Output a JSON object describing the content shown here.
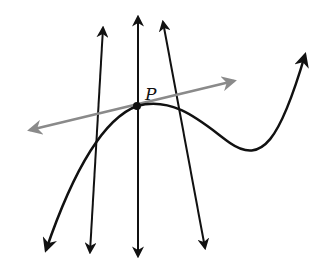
{
  "diagram": {
    "point": {
      "label": "P",
      "x": 137,
      "y": 106
    },
    "colors": {
      "curve": "#111111",
      "lines": "#111111",
      "tangent": "#8a8a8a",
      "point": "#111111"
    },
    "tangent_line": {
      "from": [
        28,
        131
      ],
      "to": [
        236,
        80
      ]
    },
    "lines_through_P": [
      {
        "name": "line-1",
        "from": [
          103,
          26
        ],
        "to": [
          90,
          254
        ]
      },
      {
        "name": "line-2",
        "from": [
          138,
          15
        ],
        "to": [
          138,
          258
        ]
      },
      {
        "name": "line-3",
        "from": [
          163,
          20
        ],
        "to": [
          205,
          250
        ]
      }
    ],
    "curve": {
      "start_arrow": [
        45,
        252
      ],
      "end_arrow": [
        306,
        52
      ],
      "local_min": [
        250,
        150
      ]
    }
  }
}
